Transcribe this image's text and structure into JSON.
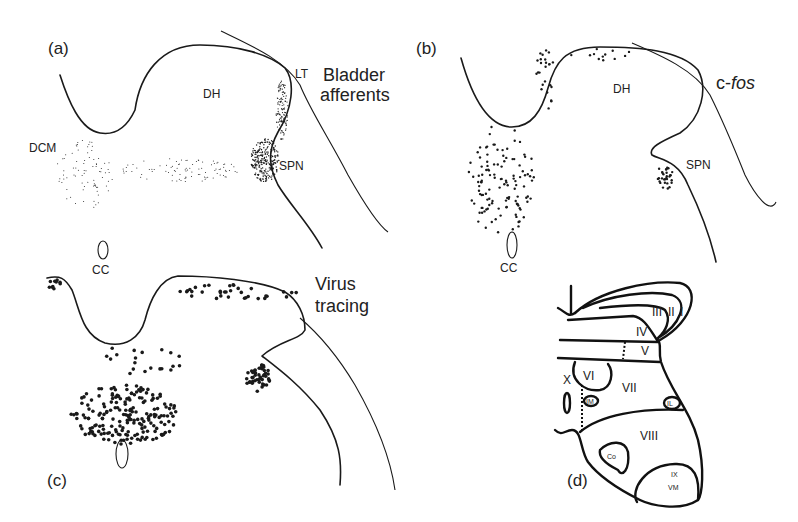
{
  "figure": {
    "panels": [
      {
        "id": "a",
        "letter": "(a)",
        "title_lines": [
          "Bladder",
          "afferents"
        ],
        "labels": {
          "dh": "DH",
          "lt": "LT",
          "dcm": "DCM",
          "spn": "SPN",
          "cc": "CC"
        }
      },
      {
        "id": "b",
        "letter": "(b)",
        "title_prefix": "c-",
        "title_italic": "fos",
        "labels": {
          "dh": "DH",
          "spn": "SPN",
          "cc": "CC"
        }
      },
      {
        "id": "c",
        "letter": "(c)",
        "title_lines": [
          "Virus",
          "tracing"
        ]
      },
      {
        "id": "d",
        "letter": "(d)",
        "laminae": [
          "I",
          "II",
          "III",
          "IV",
          "V",
          "VI",
          "VII",
          "VIII",
          "IX",
          "X"
        ],
        "nuclei": {
          "im": "IM",
          "il": "IL",
          "co": "Co",
          "vm": "VM"
        }
      }
    ]
  }
}
